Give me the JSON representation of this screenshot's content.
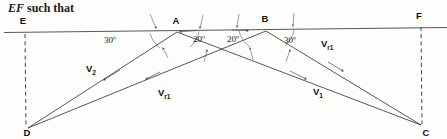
{
  "caption": {
    "italic_part": "EF",
    "rest_part": " such that"
  },
  "diagram": {
    "points": [
      {
        "id": "E",
        "label": "E",
        "x": 23,
        "y": 24
      },
      {
        "id": "F",
        "label": "F",
        "x": 419,
        "y": 19
      },
      {
        "id": "A",
        "label": "A",
        "x": 176,
        "y": 24
      },
      {
        "id": "B",
        "label": "B",
        "x": 265,
        "y": 22
      },
      {
        "id": "D",
        "label": "D",
        "x": 27,
        "y": 134
      },
      {
        "id": "C",
        "label": "C",
        "x": 423,
        "y": 131
      }
    ],
    "angles": [
      {
        "id": "angle-a-left",
        "label": "30º",
        "x": 110,
        "y": 43
      },
      {
        "id": "angle-a-right",
        "label": "20º",
        "x": 199,
        "y": 42
      },
      {
        "id": "angle-b-left",
        "label": "20º",
        "x": 233,
        "y": 42
      },
      {
        "id": "angle-b-right",
        "label": "30º",
        "x": 290,
        "y": 43
      }
    ],
    "vectors": [
      {
        "id": "v2",
        "base": "V",
        "sub": "2",
        "x": 86,
        "y": 72
      },
      {
        "id": "vr1-lower-left",
        "base": "V",
        "sub": "r1",
        "x": 158,
        "y": 96
      },
      {
        "id": "v1",
        "base": "V",
        "sub": "1",
        "x": 313,
        "y": 95
      },
      {
        "id": "vr1-upper-right",
        "base": "V",
        "sub": "r1",
        "x": 321,
        "y": 47
      }
    ],
    "colors": {
      "ink": "#3a3a3a",
      "text": "#111111",
      "background": "#fdfdfc"
    }
  }
}
